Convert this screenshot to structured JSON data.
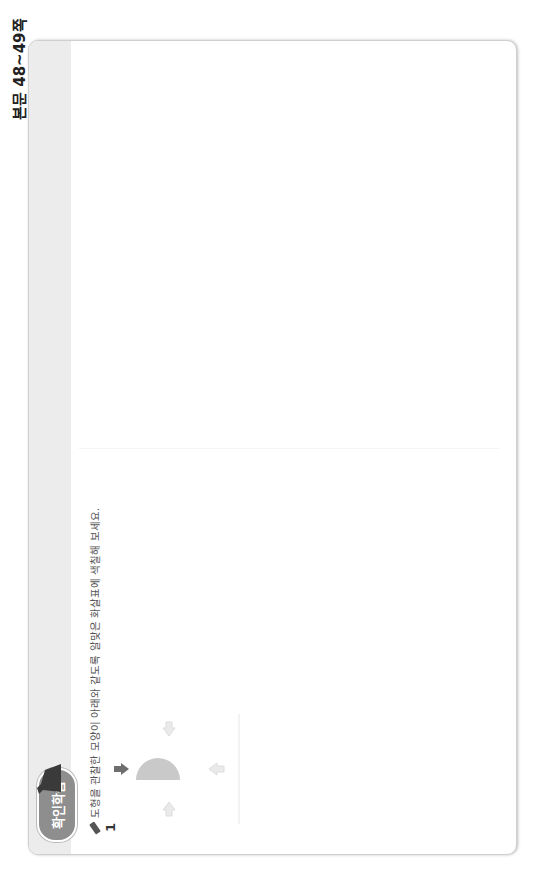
{
  "side_label": "본문 48~49쪽",
  "badge": {
    "title": "확인학습",
    "color": "#8e8e8e"
  },
  "colors": {
    "shape_fill": "#c9c9c9",
    "light_fill": "#e6e6e6",
    "arrow_dark": "#6e6e6e",
    "arrow_light": "#e2e2e2",
    "grid_line": "#d8d8d8",
    "circle": "#333333"
  },
  "left_page": {
    "page_number": "48",
    "footer_text": "초등수학",
    "sections": [
      {
        "instruction": "도형을 관찰한 모양이 아래와 같도록 알맞은 화살표에 색칠해 보세요.",
        "questions": [
          {
            "number": "1",
            "shape": "semicircle",
            "colored_arrow": "top",
            "result_view": "semicircle-right"
          },
          {
            "number": "2",
            "shape": "pentagon-left-point",
            "colored_arrow": "bottom",
            "result_view": "pentagon-bottom-point"
          },
          {
            "number": "3",
            "shape": "triangle-right-angle-bottom-left",
            "colored_arrow": "top",
            "result_view": "triangle-right-angle-top-right"
          }
        ]
      },
      {
        "instruction": "왼쪽 도형을 화살표 방향에서 바라본 모양을 찾아 ○표 하세요.",
        "questions": [
          {
            "number": "4",
            "given": "2x2 grid, bottom-right shaded",
            "options": [
              "2x2 grid, top-right shaded",
              "2x2 grid, bottom-left shaded",
              "2x2 grid, bottom-right shaded"
            ],
            "circled_option": 3
          }
        ]
      }
    ]
  },
  "right_page": {
    "page_number": "49",
    "footer_text": "3. 여러 방향에서 관찰",
    "sections": [
      {
        "instruction": "왼쪽 도형을 화살표 방향에서 바라본 모양을 찾아 ○표 하세요.",
        "questions": [
          {
            "number": "5",
            "given": "hexagram grid, two lower triangles shaded",
            "options": [
              "left rhombus shaded",
              "right rhombus shaded",
              "top triangles shaded"
            ],
            "circled_option": 3
          }
        ]
      },
      {
        "instruction": "도형을 관찰한 모양이 아래와 같도록 알맞은 화살표에 색칠해 보세요.",
        "questions": [
          {
            "number": "6",
            "shape": "2x2 grid, left column shaded",
            "colored_arrow": "top",
            "result_view": "2x2 grid, top row shaded"
          },
          {
            "number": "7",
            "shape": "hexagram grid, left parallelogram shaded",
            "colored_arrow": "top",
            "result_view": "hexagram grid, rotated triangles shaded"
          },
          {
            "number": "8",
            "shape": "2x2 grid, L-shape (top row + bottom-right)",
            "colored_arrow": "bottom",
            "result_view": "2x2 grid, L-shape (top row + bottom-left)"
          }
        ]
      }
    ]
  }
}
